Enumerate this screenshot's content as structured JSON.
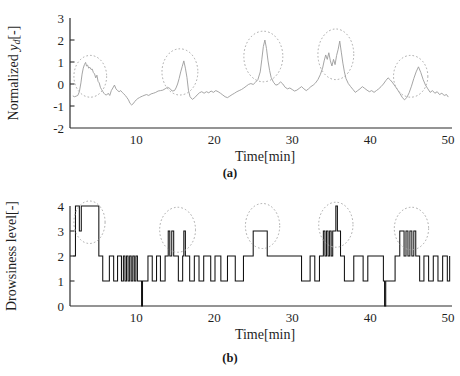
{
  "figure": {
    "background": "#ffffff",
    "signal_color_a": "#9b9b9b",
    "signal_color_b": "#111111",
    "annotation_color": "#a8a8a8",
    "axis_color": "#2a2a2a"
  },
  "panel_a": {
    "caption": "(a)",
    "ylabel_prefix": "Normalized ",
    "ylabel_symbol": "y",
    "ylabel_subscript": "d",
    "ylabel_suffix": "[-]",
    "ylabel_full": "Normalized yd[-]",
    "xlabel": "Time[min]",
    "yticks": [
      "3",
      "2",
      "1",
      "0",
      "-1",
      "-2"
    ],
    "xticks": [
      "10",
      "20",
      "30",
      "40",
      "50"
    ]
  },
  "panel_b": {
    "caption": "(b)",
    "ylabel_full": "Drowsiness  level[-]",
    "xlabel": "Time[min]",
    "yticks": [
      "4",
      "3",
      "2",
      "1",
      "0"
    ],
    "xticks": [
      "10",
      "20",
      "30",
      "40",
      "50"
    ]
  },
  "chart_data": [
    {
      "id": "panel-a",
      "type": "line",
      "title": "",
      "xlabel": "Time[min]",
      "ylabel": "Normalized yd[-]",
      "xlim": [
        1.5,
        50.5
      ],
      "ylim": [
        -2,
        3
      ],
      "xticks": [
        10,
        20,
        30,
        40,
        50
      ],
      "yticks": [
        -2,
        -1,
        0,
        1,
        2,
        3
      ],
      "grid": false,
      "legend": null,
      "series_color": "#9b9b9b",
      "annotations": [
        {
          "type": "ellipse",
          "label": "drowsiness-event-1",
          "cx": 4.1,
          "cy": 0.35,
          "rx": 2.1,
          "ry": 0.95
        },
        {
          "type": "ellipse",
          "label": "drowsiness-event-2",
          "cx": 15.6,
          "cy": 0.55,
          "rx": 2.3,
          "ry": 1.05
        },
        {
          "type": "ellipse",
          "label": "drowsiness-event-3",
          "cx": 26.3,
          "cy": 1.25,
          "rx": 2.5,
          "ry": 1.15
        },
        {
          "type": "ellipse",
          "label": "drowsiness-event-4",
          "cx": 35.6,
          "cy": 1.35,
          "rx": 2.3,
          "ry": 1.15
        },
        {
          "type": "ellipse",
          "label": "drowsiness-event-5",
          "cx": 45.2,
          "cy": 0.35,
          "rx": 2.2,
          "ry": 0.95
        }
      ],
      "x": [
        1.9,
        2.1,
        2.3,
        2.5,
        2.7,
        2.9,
        3.05,
        3.2,
        3.35,
        3.5,
        3.62,
        3.75,
        3.9,
        4.05,
        4.2,
        4.35,
        4.5,
        4.65,
        4.8,
        4.95,
        5.1,
        5.25,
        5.4,
        5.55,
        5.7,
        5.85,
        6.0,
        6.2,
        6.4,
        6.6,
        6.8,
        7.0,
        7.2,
        7.4,
        7.6,
        7.8,
        8.0,
        8.2,
        8.4,
        8.6,
        8.8,
        9.0,
        9.2,
        9.4,
        9.6,
        9.8,
        10.0,
        10.2,
        10.4,
        10.6,
        10.8,
        11.0,
        11.3,
        11.6,
        11.9,
        12.2,
        12.5,
        12.8,
        13.1,
        13.4,
        13.7,
        14.0,
        14.3,
        14.6,
        14.9,
        15.1,
        15.3,
        15.5,
        15.7,
        15.9,
        16.1,
        16.3,
        16.5,
        16.7,
        16.9,
        17.2,
        17.5,
        17.8,
        18.1,
        18.4,
        18.7,
        19.0,
        19.3,
        19.6,
        19.9,
        20.2,
        20.5,
        20.8,
        21.1,
        21.4,
        21.7,
        22.0,
        22.3,
        22.6,
        22.9,
        23.2,
        23.5,
        23.8,
        24.1,
        24.4,
        24.7,
        25.0,
        25.3,
        25.6,
        25.9,
        26.1,
        26.3,
        26.5,
        26.7,
        26.9,
        27.1,
        27.3,
        27.6,
        27.9,
        28.2,
        28.5,
        28.8,
        29.1,
        29.4,
        29.7,
        30.0,
        30.3,
        30.6,
        30.9,
        31.2,
        31.5,
        31.8,
        32.1,
        32.4,
        32.7,
        33.0,
        33.3,
        33.6,
        33.9,
        34.1,
        34.3,
        34.5,
        34.7,
        34.9,
        35.1,
        35.3,
        35.5,
        35.7,
        35.9,
        36.1,
        36.3,
        36.5,
        36.7,
        36.9,
        37.2,
        37.5,
        37.8,
        38.1,
        38.4,
        38.7,
        39.0,
        39.3,
        39.6,
        39.9,
        40.2,
        40.5,
        40.8,
        41.1,
        41.4,
        41.7,
        42.0,
        42.3,
        42.6,
        42.9,
        43.2,
        43.5,
        43.8,
        44.1,
        44.4,
        44.7,
        45.0,
        45.3,
        45.6,
        45.9,
        46.2,
        46.5,
        46.8,
        47.1,
        47.4,
        47.7,
        48.0,
        48.3,
        48.6,
        48.9,
        49.2,
        49.5,
        49.8,
        50.0
      ],
      "y": [
        -0.55,
        -0.58,
        -0.55,
        -0.52,
        -0.35,
        0.05,
        0.45,
        0.72,
        0.88,
        0.98,
        0.82,
        0.86,
        0.72,
        0.76,
        0.66,
        0.68,
        0.52,
        0.46,
        0.28,
        0.4,
        0.12,
        0.05,
        -0.15,
        -0.25,
        -0.34,
        -0.42,
        -0.48,
        -0.5,
        -0.42,
        -0.52,
        -0.3,
        -0.18,
        -0.05,
        -0.22,
        -0.3,
        -0.35,
        -0.3,
        -0.38,
        -0.45,
        -0.52,
        -0.62,
        -0.72,
        -0.88,
        -0.95,
        -0.9,
        -0.8,
        -0.72,
        -0.66,
        -0.62,
        -0.58,
        -0.55,
        -0.52,
        -0.48,
        -0.52,
        -0.45,
        -0.42,
        -0.38,
        -0.32,
        -0.3,
        -0.28,
        -0.22,
        -0.15,
        -0.2,
        -0.32,
        -0.3,
        -0.18,
        0.0,
        0.25,
        0.55,
        0.8,
        1.05,
        0.72,
        0.3,
        -0.3,
        -0.58,
        -0.7,
        -0.62,
        -0.5,
        -0.4,
        -0.35,
        -0.42,
        -0.35,
        -0.4,
        -0.32,
        -0.38,
        -0.3,
        -0.35,
        -0.42,
        -0.5,
        -0.58,
        -0.62,
        -0.55,
        -0.48,
        -0.42,
        -0.35,
        -0.3,
        -0.25,
        -0.18,
        -0.1,
        -0.02,
        0.02,
        -0.02,
        0.08,
        0.2,
        0.55,
        1.1,
        1.7,
        2.0,
        1.62,
        1.05,
        0.62,
        0.3,
        0.08,
        -0.05,
        -0.02,
        0.1,
        0.0,
        -0.15,
        -0.22,
        -0.18,
        -0.25,
        -0.32,
        -0.28,
        -0.2,
        -0.12,
        -0.22,
        -0.3,
        -0.22,
        -0.12,
        -0.05,
        0.05,
        0.2,
        0.42,
        0.72,
        1.05,
        1.32,
        1.12,
        1.42,
        1.05,
        0.82,
        1.12,
        0.88,
        1.3,
        1.58,
        1.95,
        1.45,
        0.95,
        0.55,
        0.25,
        0.02,
        -0.12,
        -0.25,
        -0.38,
        -0.3,
        -0.22,
        -0.12,
        -0.2,
        -0.28,
        -0.35,
        -0.3,
        -0.38,
        -0.3,
        -0.22,
        -0.12,
        0.0,
        0.15,
        0.28,
        0.18,
        0.05,
        -0.1,
        -0.25,
        -0.42,
        -0.6,
        -0.72,
        -0.62,
        -0.4,
        -0.1,
        0.25,
        0.55,
        0.78,
        0.52,
        0.2,
        -0.05,
        -0.22,
        -0.38,
        -0.3,
        -0.42,
        -0.35,
        -0.48,
        -0.42,
        -0.52,
        -0.48,
        -0.58,
        -0.52,
        -0.62,
        -0.58,
        -0.68
      ]
    },
    {
      "id": "panel-b",
      "type": "line",
      "title": "",
      "xlabel": "Time[min]",
      "ylabel": "Drowsiness  level[-]",
      "xlim": [
        1.5,
        50.5
      ],
      "ylim": [
        0,
        4
      ],
      "xticks": [
        10,
        20,
        30,
        40,
        50
      ],
      "yticks": [
        0,
        1,
        2,
        3,
        4
      ],
      "grid": false,
      "legend": null,
      "series_color": "#111111",
      "step": "post",
      "annotations": [
        {
          "type": "ellipse",
          "label": "drowsiness-event-1",
          "cx": 4.0,
          "cy": 3.35,
          "rx": 2.0,
          "ry": 0.85
        },
        {
          "type": "ellipse",
          "label": "drowsiness-event-2",
          "cx": 15.3,
          "cy": 3.05,
          "rx": 2.3,
          "ry": 0.9
        },
        {
          "type": "ellipse",
          "label": "drowsiness-event-3",
          "cx": 26.2,
          "cy": 3.2,
          "rx": 2.2,
          "ry": 0.9
        },
        {
          "type": "ellipse",
          "label": "drowsiness-event-4",
          "cx": 35.6,
          "cy": 3.25,
          "rx": 2.2,
          "ry": 0.9
        },
        {
          "type": "ellipse",
          "label": "drowsiness-event-5",
          "cx": 45.3,
          "cy": 3.1,
          "rx": 2.2,
          "ry": 0.85
        }
      ],
      "x": [
        1.95,
        2.2,
        2.45,
        2.7,
        2.95,
        3.2,
        3.45,
        3.7,
        5.2,
        5.45,
        5.7,
        6.3,
        6.55,
        6.8,
        7.1,
        7.35,
        7.6,
        7.85,
        8.1,
        8.35,
        8.55,
        8.75,
        8.95,
        9.15,
        9.35,
        9.55,
        9.75,
        9.95,
        10.15,
        10.35,
        10.55,
        10.68,
        10.8,
        11.0,
        11.25,
        11.5,
        11.8,
        12.05,
        12.3,
        12.6,
        12.85,
        13.1,
        13.4,
        13.7,
        13.95,
        14.1,
        14.3,
        14.55,
        14.8,
        15.1,
        15.4,
        15.7,
        15.95,
        16.1,
        16.3,
        16.55,
        16.85,
        17.15,
        17.45,
        17.75,
        18.05,
        18.35,
        18.65,
        18.95,
        19.25,
        19.55,
        19.85,
        20.1,
        20.35,
        20.6,
        20.85,
        21.1,
        21.4,
        21.7,
        22.0,
        22.35,
        22.7,
        23.05,
        23.4,
        23.75,
        24.1,
        24.4,
        24.7,
        25.0,
        25.3,
        25.6,
        25.9,
        26.2,
        26.5,
        26.8,
        27.1,
        27.4,
        27.7,
        28.0,
        28.4,
        28.8,
        29.2,
        29.6,
        30.0,
        30.4,
        30.8,
        31.2,
        31.6,
        32.0,
        32.3,
        32.6,
        32.9,
        33.2,
        33.5,
        33.75,
        34.0,
        34.2,
        34.4,
        34.6,
        34.8,
        35.0,
        35.2,
        35.4,
        35.6,
        35.8,
        36.0,
        36.2,
        36.4,
        36.7,
        37.0,
        37.3,
        37.6,
        37.9,
        38.2,
        38.5,
        38.8,
        39.1,
        39.4,
        39.7,
        40.0,
        40.3,
        40.6,
        40.9,
        41.2,
        41.5,
        41.7,
        41.85,
        42.0,
        42.3,
        42.6,
        42.9,
        43.2,
        43.5,
        43.8,
        44.1,
        44.35,
        44.6,
        44.85,
        45.1,
        45.35,
        45.6,
        45.85,
        46.1,
        46.35,
        46.6,
        46.9,
        47.2,
        47.5,
        47.8,
        48.1,
        48.4,
        48.7,
        49.0,
        49.3,
        49.6,
        49.9,
        50.2
      ],
      "y": [
        2,
        4,
        4,
        3,
        4,
        4,
        4,
        4,
        2,
        2,
        1,
        1,
        2,
        2,
        1,
        1,
        2,
        2,
        1,
        2,
        1,
        2,
        1,
        2,
        1,
        2,
        1,
        2,
        1,
        1,
        1,
        0,
        1,
        1,
        1,
        2,
        2,
        1,
        1,
        2,
        2,
        1,
        1,
        2,
        2,
        3,
        2,
        3,
        2,
        2,
        1,
        1,
        2,
        3,
        2,
        2,
        1,
        1,
        2,
        2,
        1,
        1,
        2,
        2,
        2,
        1,
        1,
        2,
        2,
        2,
        1,
        1,
        1,
        2,
        2,
        2,
        1,
        1,
        1,
        2,
        2,
        2,
        2,
        3,
        3,
        3,
        3,
        3,
        3,
        2,
        2,
        2,
        2,
        2,
        2,
        2,
        2,
        2,
        2,
        2,
        2,
        1,
        1,
        1,
        2,
        2,
        1,
        1,
        2,
        2,
        3,
        2,
        3,
        2,
        3,
        2,
        3,
        3,
        4,
        3,
        3,
        2,
        2,
        1,
        1,
        1,
        1,
        2,
        2,
        2,
        2,
        1,
        1,
        2,
        2,
        2,
        2,
        2,
        2,
        2,
        1,
        0,
        1,
        1,
        1,
        1,
        2,
        2,
        3,
        3,
        2,
        3,
        2,
        3,
        2,
        3,
        2,
        2,
        1,
        1,
        2,
        2,
        1,
        1,
        2,
        2,
        1,
        1,
        2,
        2,
        1,
        2,
        2
      ]
    }
  ]
}
